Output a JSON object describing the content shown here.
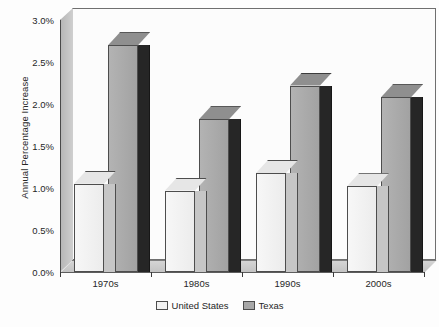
{
  "chart_data": {
    "type": "bar",
    "title": "",
    "subtitle": "",
    "xlabel": "",
    "ylabel": "Annual Percentage Increase",
    "categories": [
      "1970s",
      "1980s",
      "1990s",
      "2000s"
    ],
    "series": [
      {
        "name": "United States",
        "values": [
          1.05,
          0.97,
          1.18,
          1.02
        ],
        "color": "#f2f2f2"
      },
      {
        "name": "Texas",
        "values": [
          2.7,
          1.82,
          2.22,
          2.08
        ],
        "color": "#a8a8a8"
      }
    ],
    "ylim": [
      0.0,
      3.0
    ],
    "ytick_values": [
      0.0,
      0.5,
      1.0,
      1.5,
      2.0,
      2.5,
      3.0
    ],
    "ytick_labels": [
      "0.0%",
      "0.5%",
      "1.0%",
      "1.5%",
      "2.0%",
      "2.5%",
      "3.0%"
    ],
    "grid": false,
    "three_d": true,
    "legend_position": "bottom-center",
    "legend_entries": [
      "United States",
      "Texas"
    ]
  },
  "axis": {
    "y_title": "Annual Percentage Increase",
    "y_labels": [
      "3.0%",
      "2.5%",
      "2.0%",
      "1.5%",
      "1.0%",
      "0.5%",
      "0.0%"
    ],
    "x_labels": [
      "1970s",
      "1980s",
      "1990s",
      "2000s"
    ]
  },
  "legend": {
    "items": [
      {
        "label": "United States",
        "swatch": "light-gray-swatch"
      },
      {
        "label": "Texas",
        "swatch": "medium-gray-swatch"
      }
    ]
  },
  "colors": {
    "us_face": "#f2f2f2",
    "us_side": "#c6c6c6",
    "texas_face": "#a8a8a8",
    "texas_side": "#262626",
    "panel_background": "#fcfcfc",
    "floor": "#c9c9c9",
    "axis_line": "#4a4a4a"
  }
}
